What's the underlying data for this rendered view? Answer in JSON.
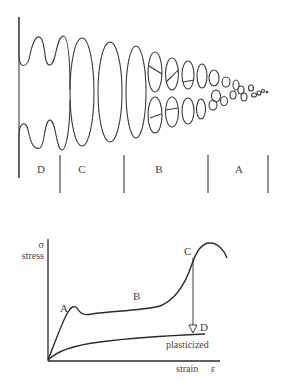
{
  "top_diagram": {
    "regions": [
      {
        "id": "D",
        "label": "D"
      },
      {
        "id": "C",
        "label": "C"
      },
      {
        "id": "B",
        "label": "B"
      },
      {
        "id": "A",
        "label": "A"
      }
    ]
  },
  "stress_strain_plot": {
    "y_axis": {
      "symbol": "σ",
      "label": "stress"
    },
    "x_axis": {
      "label": "strain",
      "symbol": "ε"
    },
    "points": {
      "A": "A",
      "B": "B",
      "C": "C",
      "D": "D"
    },
    "curve_labels": {
      "plasticized": "plasticized"
    }
  },
  "colors": {
    "line": "#333333",
    "background": "#ffffff"
  }
}
